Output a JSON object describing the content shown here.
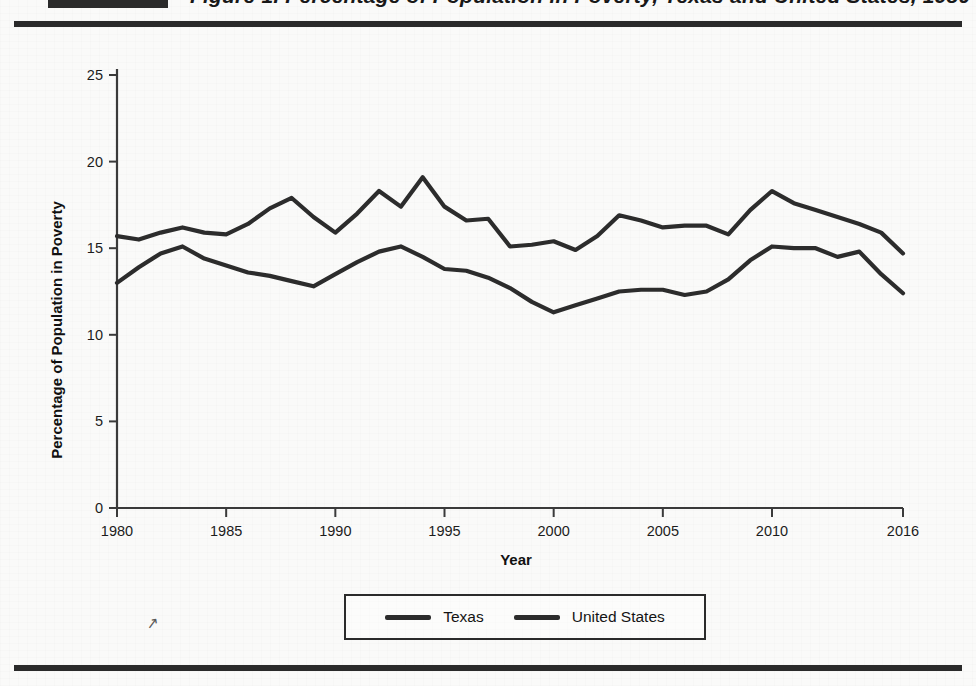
{
  "title": "Figure 1. Percentage of Population in Poverty, Texas and United States, 1980-2016",
  "stray_mark": "↗",
  "axes": {
    "y_title": "Percentage of Population in Poverty",
    "x_title": "Year",
    "y_ticks": [
      "0",
      "5",
      "10",
      "15",
      "20",
      "25"
    ],
    "x_ticks": [
      "1980",
      "1985",
      "1990",
      "1995",
      "2000",
      "2005",
      "2010",
      "2016"
    ]
  },
  "legend": {
    "items": [
      {
        "label": "Texas",
        "color": "#2c2c2c"
      },
      {
        "label": "United States",
        "color": "#2c2c2c"
      }
    ]
  },
  "chart_data": {
    "type": "line",
    "title": "Figure 1. Percentage of Population in Poverty, Texas and United States, 1980-2016",
    "xlabel": "Year",
    "ylabel": "Percentage of Population in Poverty",
    "xlim": [
      1980,
      2016
    ],
    "ylim": [
      0,
      25
    ],
    "ytick_interval": 5,
    "xtick_labels": [
      1980,
      1985,
      1990,
      1995,
      2000,
      2005,
      2010,
      2016
    ],
    "grid": false,
    "legend_position": "bottom-center",
    "x": [
      1980,
      1981,
      1982,
      1983,
      1984,
      1985,
      1986,
      1987,
      1988,
      1989,
      1990,
      1991,
      1992,
      1993,
      1994,
      1995,
      1996,
      1997,
      1998,
      1999,
      2000,
      2001,
      2002,
      2003,
      2004,
      2005,
      2006,
      2007,
      2008,
      2009,
      2010,
      2011,
      2012,
      2013,
      2014,
      2015,
      2016
    ],
    "series": [
      {
        "name": "Texas",
        "color": "#2c2c2c",
        "values": [
          15.7,
          15.5,
          15.9,
          16.2,
          15.9,
          15.8,
          16.4,
          17.3,
          17.9,
          16.8,
          15.9,
          17.0,
          18.3,
          17.4,
          19.1,
          17.4,
          16.6,
          16.7,
          15.1,
          15.2,
          15.4,
          14.9,
          15.7,
          16.9,
          16.6,
          16.2,
          16.3,
          16.3,
          15.8,
          17.2,
          18.3,
          17.6,
          17.2,
          16.8,
          16.4,
          15.9,
          14.7
        ]
      },
      {
        "name": "United States",
        "color": "#2c2c2c",
        "values": [
          13.0,
          13.9,
          14.7,
          15.1,
          14.4,
          14.0,
          13.6,
          13.4,
          13.1,
          12.8,
          13.5,
          14.2,
          14.8,
          15.1,
          14.5,
          13.8,
          13.7,
          13.3,
          12.7,
          11.9,
          11.3,
          11.7,
          12.1,
          12.5,
          12.6,
          12.6,
          12.3,
          12.5,
          13.2,
          14.3,
          15.1,
          15.0,
          15.0,
          14.5,
          14.8,
          13.5,
          12.4
        ]
      }
    ]
  }
}
